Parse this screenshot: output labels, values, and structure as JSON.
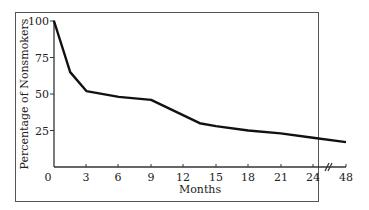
{
  "chart_data": {
    "type": "line",
    "title": "",
    "xlabel": "Months",
    "ylabel": "Percentage of Nonsmokers",
    "x_tick_labels": [
      "0",
      "3",
      "6",
      "9",
      "12",
      "15",
      "18",
      "21",
      "24",
      "48"
    ],
    "y_tick_labels": [
      "25",
      "50",
      "75",
      "100"
    ],
    "axis_break": "between 24 and 48",
    "ylim": [
      0,
      100
    ],
    "grid": false,
    "legend": null,
    "series": [
      {
        "name": "Nonsmokers",
        "x": [
          0,
          1.5,
          3,
          6,
          9,
          13.5,
          15,
          18,
          21,
          24,
          48
        ],
        "values": [
          100,
          65,
          52,
          48,
          46,
          30,
          28,
          25,
          23,
          20,
          17
        ]
      }
    ]
  }
}
